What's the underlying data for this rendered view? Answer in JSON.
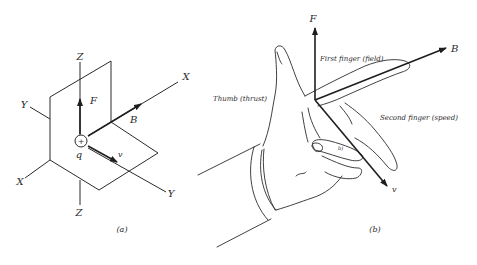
{
  "figure_a": {
    "caption": "(a)",
    "axes": {
      "z_top": "Z",
      "z_bottom": "Z",
      "y_left": "Y",
      "y_right": "Y",
      "x_left": "X",
      "x_right": "X"
    },
    "vectors": {
      "force": "F",
      "field": "B",
      "velocity": "v"
    },
    "charge": {
      "symbol": "+",
      "label": "q"
    }
  },
  "figure_b": {
    "caption": "(b)",
    "vectors": {
      "force": "F",
      "field": "B",
      "velocity": "v"
    },
    "finger_labels": {
      "first_finger": "First finger (field)",
      "second_finger": "Second finger (speed)",
      "thumb": "Thumb (thrust)"
    },
    "small_mark": "b)"
  }
}
